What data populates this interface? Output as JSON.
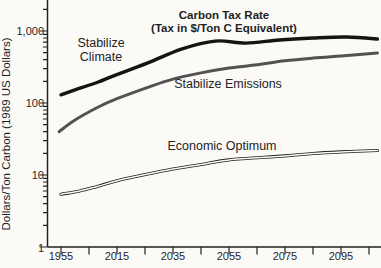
{
  "chart_data": {
    "type": "line",
    "title": "Carbon Tax Rate",
    "subtitle": "(Tax in $/Ton C Equivalent)",
    "xlabel": "",
    "ylabel": "Dollars/Ton Carbon (1989 US Dollars)",
    "y_scale_type": "log",
    "ylim": [
      1,
      2800
    ],
    "grid": false,
    "legend_position": "inline-labels",
    "y_tick_labels": [
      "1,000",
      "100",
      "10",
      "1"
    ],
    "y_tick_values": [
      1000,
      100,
      10,
      1
    ],
    "x_tick_labels": [
      "1955",
      "2015",
      "2035",
      "2055",
      "2075",
      "2095"
    ],
    "colors": {
      "background": "#fbfaf7",
      "axis": "#222222",
      "stabilize_climate": "#141414",
      "stabilize_emissions": "#525252",
      "economic_optimum": "#1d1d1d"
    },
    "series": [
      {
        "name": "Stabilize Climate",
        "label_line1": "Stabilize",
        "label_line2": "Climate",
        "style": "thick-solid",
        "thickness_px": 3.4,
        "color_key": "stabilize_climate",
        "points": [
          [
            1955,
            130
          ],
          [
            1970,
            152
          ],
          [
            1995,
            196
          ],
          [
            2010,
            235
          ],
          [
            2026,
            360
          ],
          [
            2038,
            560
          ],
          [
            2050,
            725
          ],
          [
            2061,
            680
          ],
          [
            2073,
            750
          ],
          [
            2085,
            800
          ],
          [
            2097,
            825
          ],
          [
            2108,
            775
          ]
        ]
      },
      {
        "name": "Stabilize Emissions",
        "label_line1": "Stabilize Emissions",
        "label_line2": "",
        "style": "thick-solid",
        "thickness_px": 3.0,
        "color_key": "stabilize_emissions",
        "points": [
          [
            1953,
            40
          ],
          [
            1970,
            58
          ],
          [
            1995,
            88
          ],
          [
            2015,
            115
          ],
          [
            2026,
            165
          ],
          [
            2035,
            215
          ],
          [
            2045,
            262
          ],
          [
            2055,
            305
          ],
          [
            2065,
            340
          ],
          [
            2075,
            385
          ],
          [
            2085,
            420
          ],
          [
            2095,
            450
          ],
          [
            2108,
            495
          ]
        ]
      },
      {
        "name": "Economic Optimum",
        "label_line1": "Economic Optimum",
        "label_line2": "",
        "style": "double-line",
        "thickness_px": 3.1,
        "core_px": 1.5,
        "color_key": "economic_optimum",
        "points": [
          [
            1955,
            5.4
          ],
          [
            1975,
            6.0
          ],
          [
            1995,
            7.0
          ],
          [
            2015,
            8.3
          ],
          [
            2026,
            10.3
          ],
          [
            2035,
            12.1
          ],
          [
            2045,
            14.0
          ],
          [
            2055,
            16.2
          ],
          [
            2075,
            18.4
          ],
          [
            2085,
            19.9
          ],
          [
            2095,
            20.9
          ],
          [
            2108,
            21.9
          ]
        ]
      }
    ],
    "layout": {
      "plot": {
        "left": 47.5,
        "top": 0,
        "right": 381,
        "bottom": 247
      },
      "x_scale_anchors": {
        "years": [
          1955,
          2015,
          2110
        ],
        "px": [
          61,
          117,
          383
        ]
      },
      "y_scale": {
        "y_at_value_1": 247,
        "px_per_decade": 72
      },
      "x_major_tick_px": [
        61,
        117,
        173,
        229,
        285,
        341
      ],
      "x_minor_tick_px": [
        89,
        145,
        201,
        257,
        313,
        369
      ],
      "tick_len_x": 7.5,
      "tick_len_y_major": 8,
      "tick_len_y_minor": 4.5
    }
  }
}
